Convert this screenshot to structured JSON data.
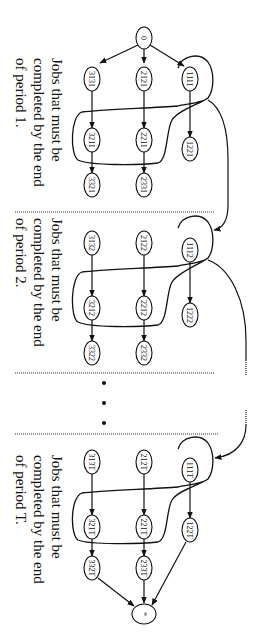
{
  "diagram": {
    "orientation": "rotated-90-clockwise",
    "source_node": {
      "id": "0",
      "label": "0"
    },
    "sink_node": {
      "id": "*",
      "label": "*"
    },
    "periods": [
      {
        "name": "period-1",
        "label_lines": [
          "Jobs that must be",
          "completed by the end",
          "of period 1."
        ],
        "nodes": {
          "row1": [
            "3131",
            "2121",
            "1111"
          ],
          "row2": [
            "3211",
            "2211",
            "1221"
          ],
          "row3": [
            "3321",
            "2331"
          ]
        }
      },
      {
        "name": "period-2",
        "label_lines": [
          "Jobs that must be",
          "completed by the end",
          "of period 2."
        ],
        "nodes": {
          "row1": [
            "3132",
            "2122",
            "1112"
          ],
          "row2": [
            "3212",
            "2212",
            "1222"
          ],
          "row3": [
            "3322",
            "2332"
          ]
        }
      },
      {
        "name": "period-T",
        "label_lines": [
          "Jobs that must be",
          "completed by the end",
          "of period T."
        ],
        "nodes": {
          "row1": [
            "313T",
            "212T",
            "111T"
          ],
          "row2": [
            "321T",
            "221T",
            "122T"
          ],
          "row3": [
            "332T",
            "233T"
          ]
        }
      }
    ],
    "ellipsis": "• • •",
    "edges": [
      [
        "0",
        "3131"
      ],
      [
        "0",
        "2121"
      ],
      [
        "0",
        "1111"
      ],
      [
        "3131",
        "3211"
      ],
      [
        "3211",
        "3321"
      ],
      [
        "2121",
        "2211"
      ],
      [
        "2211",
        "2331"
      ],
      [
        "1111",
        "1221"
      ],
      [
        "3132",
        "3212"
      ],
      [
        "3212",
        "3322"
      ],
      [
        "2122",
        "2212"
      ],
      [
        "2212",
        "2332"
      ],
      [
        "1112",
        "1222"
      ],
      [
        "313T",
        "321T"
      ],
      [
        "321T",
        "332T"
      ],
      [
        "212T",
        "221T"
      ],
      [
        "221T",
        "233T"
      ],
      [
        "111T",
        "122T"
      ],
      [
        "332T",
        "*"
      ],
      [
        "233T",
        "*"
      ],
      [
        "122T",
        "*"
      ],
      [
        "group-1",
        "1112-group"
      ],
      [
        "group-2",
        "...(dotted)...",
        "111T-group"
      ]
    ]
  }
}
